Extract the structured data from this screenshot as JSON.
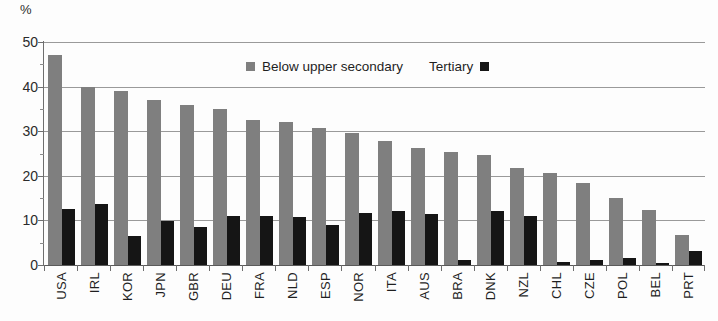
{
  "chart_data": {
    "type": "bar",
    "title": "",
    "subtitle": "",
    "xlabel": "",
    "ylabel": "%",
    "ylim": [
      0,
      50
    ],
    "yticks": [
      0,
      10,
      20,
      30,
      40,
      50
    ],
    "ytick_labels": [
      "0",
      "10",
      "20",
      "30",
      "40",
      "50"
    ],
    "grid": true,
    "grouping": "grouped",
    "legend_position": "top-center",
    "categories": [
      "USA",
      "IRL",
      "KOR",
      "JPN",
      "GBR",
      "DEU",
      "FRA",
      "NLD",
      "ESP",
      "NOR",
      "ITA",
      "AUS",
      "BRA",
      "DNK",
      "NZL",
      "CHL",
      "CZE",
      "POL",
      "BEL",
      "PRT"
    ],
    "series": [
      {
        "name": "Below upper secondary",
        "color": "#7f7f7f",
        "values": [
          47.0,
          40.0,
          39.0,
          36.9,
          35.9,
          35.0,
          32.5,
          32.0,
          30.8,
          29.6,
          27.8,
          26.3,
          25.3,
          24.7,
          21.8,
          20.6,
          18.5,
          15.0,
          12.4,
          6.7
        ]
      },
      {
        "name": "Tertiary",
        "color": "#151515",
        "values": [
          12.6,
          13.7,
          6.5,
          9.9,
          8.6,
          11.0,
          11.1,
          10.8,
          9.0,
          11.6,
          12.0,
          11.5,
          1.2,
          12.1,
          11.0,
          0.7,
          1.2,
          1.6,
          0.4,
          3.2
        ]
      }
    ]
  },
  "axis": {
    "unit_label": "%"
  },
  "legend": {
    "entries": [
      {
        "label": "Below upper secondary",
        "swatch": "gray-square-icon"
      },
      {
        "label": "Tertiary",
        "swatch": "black-square-icon"
      }
    ]
  }
}
